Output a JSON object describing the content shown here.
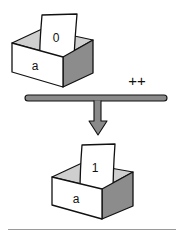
{
  "diagram": {
    "type": "increment-operator-illustration",
    "operator_label": "++",
    "before": {
      "variable_name": "a",
      "value": "0"
    },
    "after": {
      "variable_name": "a",
      "value": "1"
    },
    "colors": {
      "stroke": "#111111",
      "front_face": "#ffffff",
      "side_face": "#8c8c8c",
      "inner_wall": "#cfcfcf",
      "paper": "#ffffff",
      "arrow_fill": "#8a8a8a",
      "baseline": "#9a9a9a"
    }
  }
}
